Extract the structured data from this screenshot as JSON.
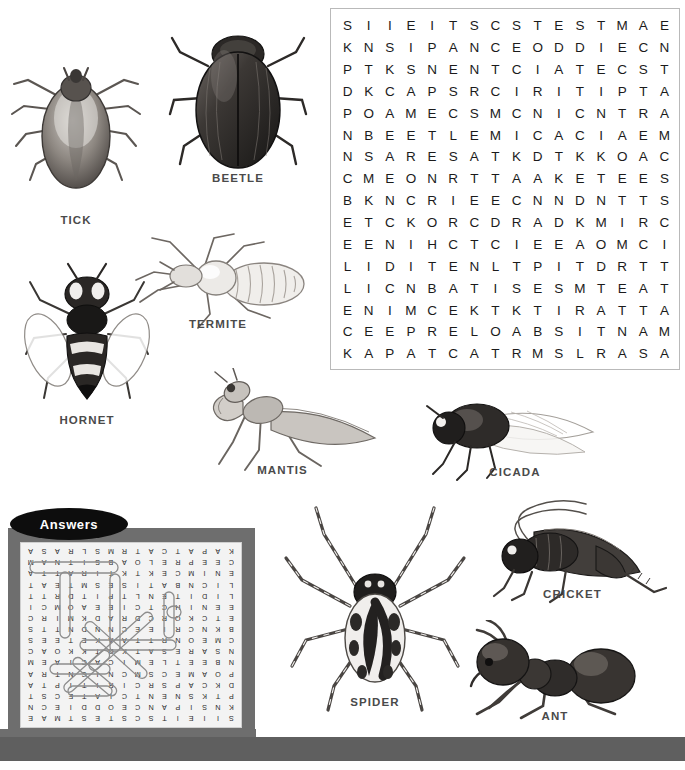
{
  "puzzle": {
    "title": "Insect Word Search",
    "rows": 16,
    "cols": 16,
    "grid": [
      "SIIEITSCSTESTMAE",
      "KNSIPANCEODDIECN",
      "PTKSNENTCIATECST",
      "DKCAPSRCIRITIPTA",
      "POAMECSMCNICNTRA",
      "NBEETLEMICACIAEM",
      "NSARESATKDTKKOAC",
      "CMEONRTTAAKETEES",
      "BKNCRIEECNNDNTTS",
      "ETCKORCDRADKMIRC",
      "EENIHCTCIEEAOMCI",
      "LIDITENLTPITDRTT",
      "LICNBATISESMTEAT",
      "ENIMCEKTKTIRATTA",
      "CEEPRELOABSITNAM",
      "KAPATCATRMSLRASA"
    ]
  },
  "insects": [
    {
      "name": "tick",
      "label": "TICK",
      "icon": "tick-illustration"
    },
    {
      "name": "beetle",
      "label": "BEETLE",
      "icon": "beetle-illustration"
    },
    {
      "name": "termite",
      "label": "TERMITE",
      "icon": "termite-illustration"
    },
    {
      "name": "hornet",
      "label": "HORNET",
      "icon": "hornet-illustration"
    },
    {
      "name": "mantis",
      "label": "MANTIS",
      "icon": "mantis-illustration"
    },
    {
      "name": "cicada",
      "label": "CICADA",
      "icon": "cicada-illustration"
    },
    {
      "name": "cricket",
      "label": "CRICKET",
      "icon": "cricket-illustration"
    },
    {
      "name": "spider",
      "label": "SPIDER",
      "icon": "spider-illustration"
    },
    {
      "name": "ant",
      "label": "ANT",
      "icon": "ant-illustration"
    }
  ],
  "answers": {
    "badge_label": "Answers",
    "orientation": "rotated-180",
    "note": "solution grid with found words circled"
  },
  "colors": {
    "page_background": "#ffffff",
    "grid_letter": "#1b1b1b",
    "grid_border": "#b9b9b9",
    "caption": "#4a4a4a",
    "answers_panel": "#6e6e6e",
    "answers_paper": "#f3f3f3",
    "badge_fill": "#0d0d0d",
    "badge_text": "#ffffff",
    "bottom_band": "#5f5f5f"
  }
}
